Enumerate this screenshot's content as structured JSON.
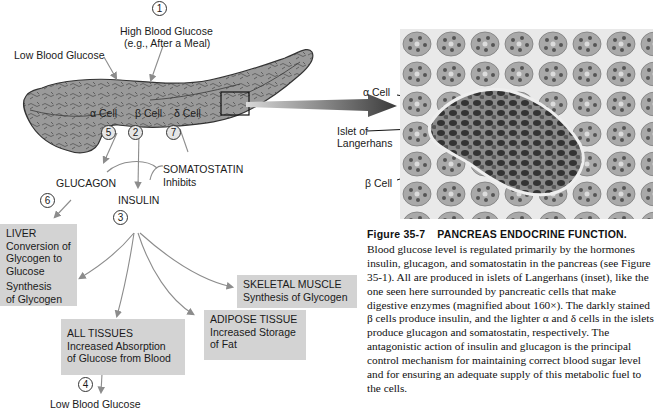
{
  "figure": {
    "number": "Figure 35-7",
    "title": "PANCREAS ENDOCRINE FUNCTION.",
    "caption": "Blood glucose level is regulated primarily by the hormones insulin, glucagon, and somatostatin in the pancreas (see Figure 35-1). All are produced in islets of Langerhans (inset), like the one seen here surrounded by pancreatic cells that make digestive enzymes (magnified about 160×). The darkly stained β cells produce insulin, and the lighter α and δ cells in the islets produce glucagon and somatostatin, respectively. The antagonistic action of insulin and glucagon is the principal control mechanism for maintaining correct blood sugar level and for ensuring an adequate supply of this metabolic fuel to the cells."
  },
  "diagram": {
    "steps": {
      "s1": "1",
      "s2": "2",
      "s3": "3",
      "s4": "4",
      "s5": "5",
      "s6": "6",
      "s7": "7"
    },
    "labels": {
      "high_glucose_line1": "High Blood Glucose",
      "high_glucose_line2": "(e.g., After a Meal)",
      "low_glucose_top": "Low Blood Glucose",
      "alpha_cell": "α Cell",
      "beta_cell": "β Cell",
      "delta_cell": "δ Cell",
      "glucagon": "GLUCAGON",
      "insulin": "INSULIN",
      "somatostatin": "SOMATOSTATIN",
      "inhibits": "Inhibits",
      "low_glucose_bottom": "Low Blood Glucose"
    },
    "boxes": {
      "liver": {
        "title": "LIVER",
        "line1": "Conversion of",
        "line2": "Glycogen to",
        "line3": "Glucose",
        "line4": "Synthesis",
        "line5": "of Glycogen"
      },
      "skeletal_muscle": {
        "title": "SKELETAL MUSCLE",
        "line1": "Synthesis of Glycogen"
      },
      "adipose": {
        "title": "ADIPOSE TISSUE",
        "line1": "Increased Storage",
        "line2": "of Fat"
      },
      "all_tissues": {
        "title": "ALL TISSUES",
        "line1": "Increased Absorption",
        "line2": "of Glucose from Blood"
      }
    }
  },
  "micrograph": {
    "labels": {
      "alpha_cell": "α Cell",
      "islet_line1": "Islet of",
      "islet_line2": "Langerhans",
      "beta_cell": "β Cell"
    }
  }
}
